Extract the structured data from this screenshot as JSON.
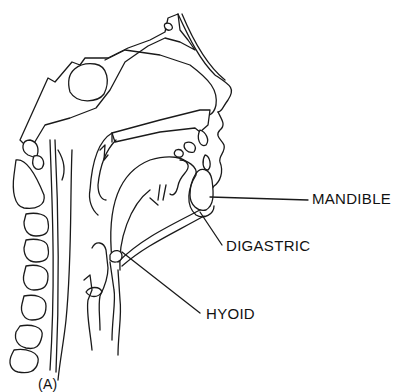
{
  "figure": {
    "panel_label": "(A)",
    "labels": [
      {
        "id": "mandible",
        "text": "MANDIBLE"
      },
      {
        "id": "digastric",
        "text": "DIGASTRIC"
      },
      {
        "id": "hyoid",
        "text": "HYOID"
      }
    ],
    "colors": {
      "line": "#1a1a1a",
      "background": "#ffffff"
    }
  }
}
